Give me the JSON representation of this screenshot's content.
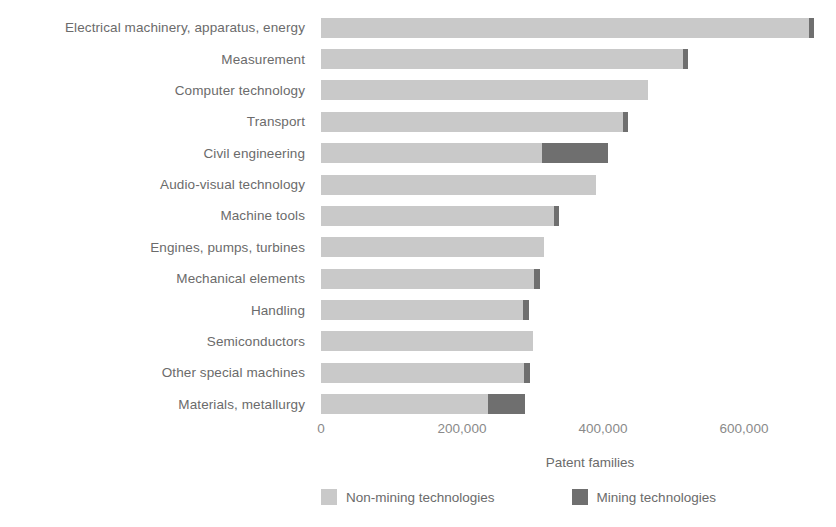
{
  "chart_data": {
    "type": "bar",
    "orientation": "horizontal",
    "stacked": true,
    "title": "",
    "xlabel": "Patent families",
    "ylabel": "",
    "xlim": [
      0,
      709219
    ],
    "xticks": [
      0,
      200000,
      400000,
      600000
    ],
    "xtick_labels": [
      "0",
      "200,000",
      "400,000",
      "600,000"
    ],
    "grid": false,
    "legend_position": "bottom",
    "categories": [
      "Electrical machinery, apparatus, energy",
      "Measurement",
      "Computer technology",
      "Transport",
      "Civil engineering",
      "Audio-visual technology",
      "Machine tools",
      "Engines, pumps, turbines",
      "Mechanical elements",
      "Handling",
      "Semiconductors",
      "Other special machines",
      "Materials, metallurgy"
    ],
    "series": [
      {
        "name": "Non-mining technologies",
        "color": "#c9c9c9",
        "values": [
          692000,
          514000,
          464000,
          428000,
          313000,
          390000,
          330000,
          316000,
          302000,
          287000,
          301000,
          288000,
          237000
        ]
      },
      {
        "name": "Mining technologies",
        "color": "#6f6f6f",
        "values": [
          8000,
          6000,
          0,
          7000,
          94000,
          0,
          8000,
          0,
          8000,
          8000,
          0,
          8000,
          52000
        ]
      }
    ],
    "totals": [
      700000,
      520000,
      464000,
      435000,
      407000,
      390000,
      338000,
      316000,
      310000,
      295000,
      301000,
      296000,
      289000
    ]
  },
  "legend": {
    "items": [
      {
        "label": "Non-mining technologies",
        "swatch": "legend-swatch-non-mining"
      },
      {
        "label": "Mining technologies",
        "swatch": "legend-swatch-mining"
      }
    ]
  },
  "colors": {
    "non_mining": "#c9c9c9",
    "mining": "#6f6f6f",
    "text": "#6b6b6b",
    "background": "#ffffff"
  }
}
